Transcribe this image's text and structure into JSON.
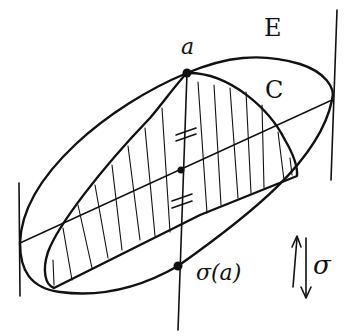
{
  "diagram": {
    "labels": {
      "point_a": "a",
      "ellipse_E": "E",
      "region_C": "C",
      "reflected_point": "σ(a)",
      "reflection": "σ"
    },
    "elements": {
      "ellipse": "E",
      "convex_region": "C (hatched)",
      "diameter": "line through tangent points of E",
      "tangent_lines": 2,
      "equal_segment_marks": [
        "≠ tick at upper half",
        "≠ tick at lower half"
      ],
      "reflection_arrows": "up and down arrows beside σ"
    },
    "colors": {
      "ink": "#111111",
      "background": "#ffffff"
    }
  }
}
